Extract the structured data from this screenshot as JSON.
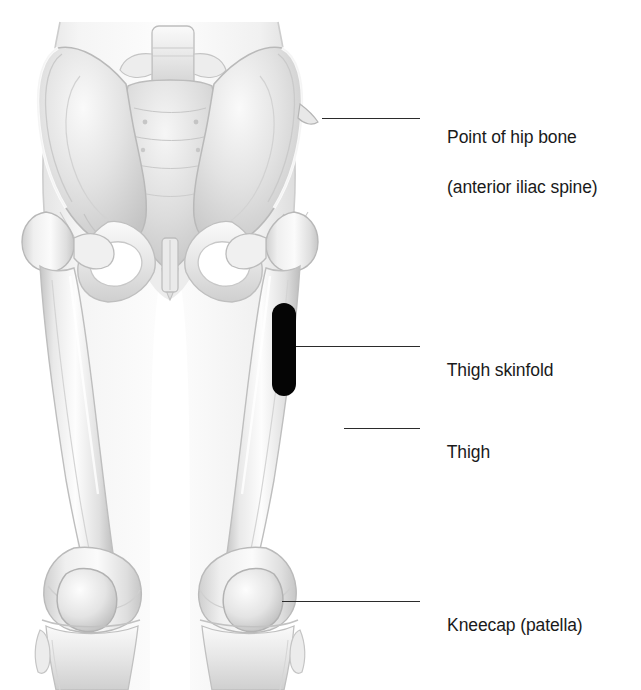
{
  "figure": {
    "background_color": "#ffffff",
    "line_color": "#2b2b2b",
    "text_color": "#1a1a1a",
    "marker_color": "#050505",
    "bone_fill": "#f2f2f2",
    "bone_shade": "#c9c9c9",
    "body_fill": "#fafafa"
  },
  "callouts": [
    {
      "id": "hip-bone",
      "line1": "Point of hip bone",
      "line2": "(anterior iliac spine)",
      "text_x": 428,
      "text_y": 100,
      "leader": {
        "x1": 322,
        "y1": 118,
        "x2": 420,
        "y2": 118
      }
    },
    {
      "id": "thigh-skinfold",
      "line1": "Thigh skinfold",
      "line2": "",
      "text_x": 428,
      "text_y": 333,
      "leader": {
        "x1": 296,
        "y1": 346,
        "x2": 420,
        "y2": 346
      }
    },
    {
      "id": "thigh",
      "line1": "Thigh",
      "line2": "",
      "text_x": 428,
      "text_y": 415,
      "leader": {
        "x1": 344,
        "y1": 428,
        "x2": 420,
        "y2": 428
      }
    },
    {
      "id": "kneecap",
      "line1": "Kneecap (patella)",
      "line2": "",
      "text_x": 428,
      "text_y": 588,
      "leader": {
        "x1": 282,
        "y1": 601,
        "x2": 420,
        "y2": 601
      }
    }
  ],
  "skinfold_marker": {
    "label": "thigh skinfold pinch site",
    "x": 272,
    "y": 303,
    "width": 24,
    "height": 93
  },
  "anatomy_parts": [
    "lumbar-vertebra",
    "sacrum",
    "left-ilium",
    "right-ilium",
    "iliac-crest",
    "anterior-iliac-spine",
    "pubic-symphysis",
    "obturator-foramen",
    "left-femur",
    "right-femur",
    "femoral-head",
    "greater-trochanter",
    "left-patella",
    "right-patella",
    "tibia",
    "fibula",
    "body-silhouette"
  ]
}
